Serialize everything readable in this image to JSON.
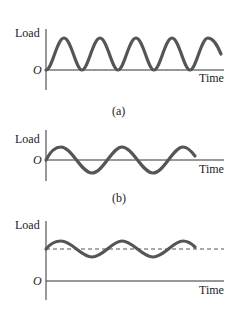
{
  "panels": [
    {
      "id": "a",
      "caption": "(a)",
      "y_label": "Load",
      "x_label": "Time",
      "origin_label": "O",
      "description": "Fluctuating load from zero to maximum (repeated, zero-to-max)",
      "mean_line": false
    },
    {
      "id": "b",
      "caption": "(b)",
      "y_label": "Load",
      "x_label": "Time",
      "origin_label": "O",
      "description": "Fully reversed load oscillating about zero",
      "mean_line": false
    },
    {
      "id": "c",
      "caption": "",
      "y_label": "Load",
      "x_label": "Time",
      "origin_label": "O",
      "description": "Fluctuating load about a nonzero mean (dashed line)",
      "mean_line": true
    }
  ],
  "colors": {
    "curve": "#555555",
    "axis": "#333333",
    "dashed": "#555555"
  }
}
